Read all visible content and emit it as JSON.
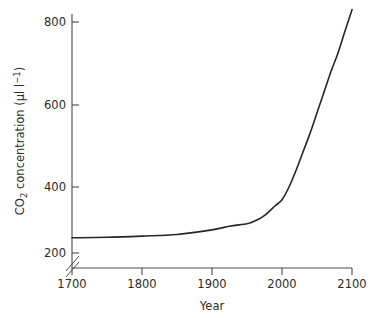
{
  "chart_data": {
    "type": "line",
    "title": "",
    "xlabel": "Year",
    "ylabel": "CO2 concentration (μl l-1)",
    "ylabel_parts": {
      "prefix": "CO",
      "subscript": "2",
      "middle": " concentration (μl l",
      "superscript": "−1",
      "suffix": ")"
    },
    "xlim": [
      1700,
      2100
    ],
    "ylim": [
      260,
      860
    ],
    "xticks": [
      1700,
      1800,
      1900,
      2000,
      2100
    ],
    "xtick_labels": [
      "1700",
      "1800",
      "1900",
      "2000",
      "2100"
    ],
    "yticks": [
      200,
      400,
      600,
      800
    ],
    "ytick_labels": [
      "200",
      "400",
      "600",
      "800"
    ],
    "grid": false,
    "legend": "none",
    "axis_break": {
      "axis": "y",
      "description": "double-slash break on y-axis below 200",
      "label": "axis-break"
    },
    "series": [
      {
        "name": "CO2 concentration",
        "x": [
          1700,
          1750,
          1800,
          1850,
          1900,
          1925,
          1950,
          1960,
          1970,
          1980,
          1990,
          2000,
          2010,
          2020,
          2030,
          2040,
          2050,
          2060,
          2070,
          2080,
          2090,
          2100
        ],
        "values": [
          277,
          278,
          281,
          285,
          296,
          305,
          311,
          317,
          325,
          338,
          354,
          369,
          400,
          440,
          485,
          530,
          580,
          630,
          680,
          725,
          778,
          830
        ]
      }
    ],
    "colors": {
      "curve": "#262626",
      "axis": "#4a4a4a",
      "text": "#2b2b2b",
      "background": "#ffffff"
    }
  },
  "axis_titles": {
    "x": "Year"
  }
}
